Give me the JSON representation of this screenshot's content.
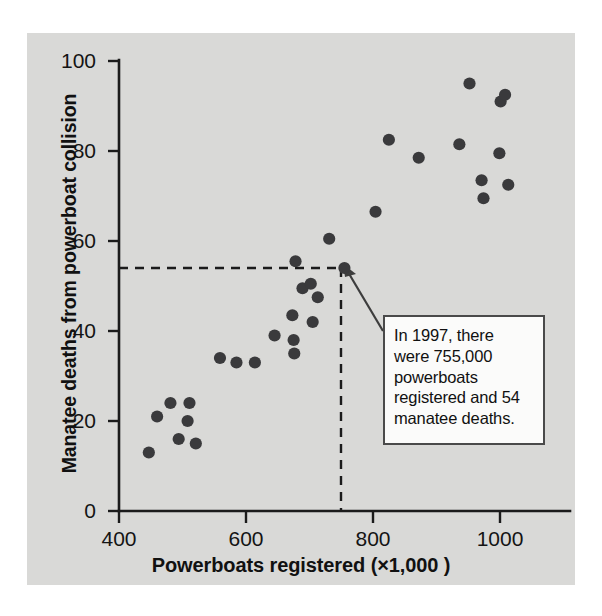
{
  "figure": {
    "panel_color": "#d9d9d7",
    "point_color": "#3a3a3c",
    "axis_color": "#1b1b1b"
  },
  "axes": {
    "xlabel": "Powerboats registered (×1,000 )",
    "ylabel": "Manatee deaths from powerboat collision",
    "xticks": [
      "400",
      "600",
      "800",
      "1000"
    ],
    "yticks": [
      "100",
      "80",
      "60",
      "40",
      "20",
      "0"
    ]
  },
  "callout": {
    "text": "In 1997, there were 755,000 powerboats registered and 54 manatee deaths.",
    "line1": "In 1997, there",
    "line2": "were 755,000",
    "line3": "powerboats",
    "line4": "registered and 54",
    "line5": "manatee deaths."
  },
  "highlight": {
    "x": 755,
    "y": 54,
    "year": 1997,
    "guide_y_value": 54,
    "guide_x_value": 755
  },
  "chart_data": {
    "type": "scatter",
    "title": "",
    "xlabel": "Powerboats registered (×1,000 )",
    "ylabel": "Manatee deaths from powerboat collision",
    "xlim": [
      400,
      1047
    ],
    "ylim": [
      0,
      100
    ],
    "xticks": [
      400,
      600,
      800,
      1000
    ],
    "yticks": [
      0,
      20,
      40,
      60,
      80,
      100
    ],
    "grid": false,
    "legend": null,
    "annotations": [
      {
        "text": "In 1997, there were 755,000 powerboats registered and 54 manatee deaths.",
        "points_to": [
          755,
          54
        ]
      }
    ],
    "guides": [
      {
        "type": "horizontal",
        "value": 54,
        "from_x": 400,
        "to_x": 755,
        "style": "dashed"
      },
      {
        "type": "vertical",
        "value": 755,
        "from_y": 0,
        "to_y": 54,
        "style": "dashed"
      }
    ],
    "points": [
      {
        "x": 447,
        "y": 13
      },
      {
        "x": 460,
        "y": 21
      },
      {
        "x": 481,
        "y": 24
      },
      {
        "x": 494,
        "y": 16
      },
      {
        "x": 511,
        "y": 24
      },
      {
        "x": 508,
        "y": 20
      },
      {
        "x": 521,
        "y": 15
      },
      {
        "x": 559,
        "y": 34
      },
      {
        "x": 585,
        "y": 33
      },
      {
        "x": 614,
        "y": 33
      },
      {
        "x": 645,
        "y": 39
      },
      {
        "x": 673,
        "y": 43.5
      },
      {
        "x": 675,
        "y": 38
      },
      {
        "x": 676,
        "y": 35
      },
      {
        "x": 678,
        "y": 55.5
      },
      {
        "x": 689,
        "y": 49.5
      },
      {
        "x": 702,
        "y": 50.5
      },
      {
        "x": 713,
        "y": 47.5
      },
      {
        "x": 705,
        "y": 42
      },
      {
        "x": 731,
        "y": 60.5
      },
      {
        "x": 755,
        "y": 54
      },
      {
        "x": 804,
        "y": 66.5
      },
      {
        "x": 825,
        "y": 82.5
      },
      {
        "x": 872,
        "y": 78.5
      },
      {
        "x": 936,
        "y": 81.5
      },
      {
        "x": 952,
        "y": 95
      },
      {
        "x": 971,
        "y": 73.5
      },
      {
        "x": 974,
        "y": 69.5
      },
      {
        "x": 1001,
        "y": 91
      },
      {
        "x": 1008,
        "y": 92.5
      },
      {
        "x": 999,
        "y": 79.5
      },
      {
        "x": 1013,
        "y": 72.5
      }
    ]
  }
}
